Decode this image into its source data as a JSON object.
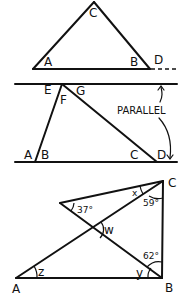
{
  "figures": [
    {
      "name": "triangle-exterior-angle",
      "labels": {
        "C": "C",
        "A": "A",
        "B": "B",
        "D": "D"
      }
    },
    {
      "name": "parallel-lines-transversals",
      "labels": {
        "E": "E",
        "F": "F",
        "G": "G",
        "A": "A",
        "B": "B",
        "C": "C",
        "D": "D"
      },
      "annotation": "PARALLEL"
    },
    {
      "name": "crossed-triangles",
      "labels": {
        "A": "A",
        "B": "B",
        "C": "C"
      },
      "angles": {
        "x": "x",
        "w": "w",
        "y": "y",
        "z": "z",
        "a37": "37°",
        "a59": "59°",
        "a62": "62°"
      }
    }
  ]
}
